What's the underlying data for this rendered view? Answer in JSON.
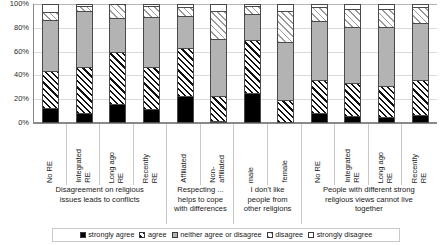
{
  "chart_data": {
    "type": "bar",
    "subtype": "stacked-percentage-column",
    "title": "",
    "xlabel": "",
    "ylabel": "",
    "ylim": [
      0,
      100
    ],
    "ytick_labels": [
      "0%",
      "20%",
      "40%",
      "60%",
      "80%",
      "100%"
    ],
    "ytick_values": [
      0,
      20,
      40,
      60,
      80,
      100
    ],
    "grid": true,
    "legend_position": "bottom",
    "series": [
      {
        "name": "strongly agree",
        "key": "strongly-agree",
        "fill": "solid-black",
        "values": [
          12,
          8,
          15,
          11,
          22,
          1,
          25,
          0,
          8,
          5,
          4,
          6
        ]
      },
      {
        "name": "agree",
        "key": "agree",
        "fill": "diagonal-hatch-black",
        "values": [
          32,
          39,
          45,
          36,
          41,
          21,
          45,
          19,
          28,
          28,
          27,
          30
        ]
      },
      {
        "name": "neither agree or disagree",
        "key": "neither-agree-or-disagree",
        "fill": "solid-grey",
        "values": [
          43,
          48,
          29,
          43,
          28,
          49,
          22,
          49,
          50,
          48,
          50,
          49
        ]
      },
      {
        "name": "disagree",
        "key": "disagree",
        "fill": "diagonal-hatch-grey",
        "values": [
          7,
          4,
          11,
          9,
          7,
          24,
          7,
          27,
          12,
          16,
          16,
          13
        ]
      },
      {
        "name": "strongly disagree",
        "key": "strongly-disagree",
        "fill": "white",
        "values": [
          6,
          1,
          0,
          1,
          2,
          5,
          1,
          5,
          2,
          3,
          3,
          2
        ]
      }
    ],
    "categories": [
      "No RE",
      "Integrated\nRE",
      "Long ago\nRE",
      "Recently\nRE",
      "Affiliated",
      "Non-\naffiliated",
      "male",
      "female",
      "No RE",
      "Integrated\nRE",
      "Long ago\nRE",
      "Recently\nRE"
    ],
    "groups": [
      {
        "label": "Disagreement on religious\nissues leads to conflicts",
        "span": 4
      },
      {
        "label": "Respecting ...\nhelps to cope\nwith differences",
        "span": 2
      },
      {
        "label": "I don't like\npeople from\nother religions",
        "span": 2
      },
      {
        "label": "People with different strong\nreligious views cannot live\ntogether",
        "span": 4
      }
    ],
    "colors": {
      "strongly-agree": "#000000",
      "agree": "#111111",
      "neither-agree-or-disagree": "#b3b3b3",
      "disagree": "#9a9a9a",
      "strongly-disagree": "#ffffff",
      "axis": "#8a8a8a",
      "gridline": "#d9d9d9",
      "background": "#ffffff"
    }
  },
  "axis": {
    "y_labels": [
      "100%",
      "80%",
      "60%",
      "40%",
      "20%",
      "0%"
    ]
  },
  "legend": {
    "items": [
      {
        "label": "strongly agree"
      },
      {
        "label": "agree"
      },
      {
        "label": "neither agree or disagree"
      },
      {
        "label": "disagree"
      },
      {
        "label": "strongly disagree"
      }
    ]
  }
}
